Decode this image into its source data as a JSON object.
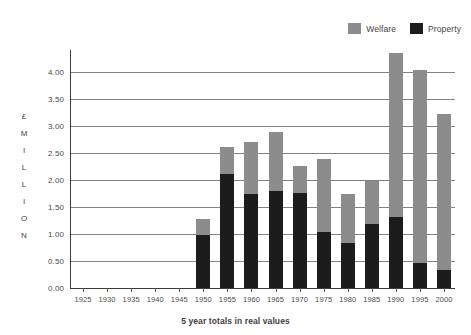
{
  "chart_data": {
    "type": "bar",
    "subtype": "stacked-vertical",
    "title": "",
    "xlabel": "5 year totals in real values",
    "ylabel": "£ MILLION",
    "ylabel_letters": [
      "£",
      "M",
      "I",
      "L",
      "L",
      "I",
      "O",
      "N"
    ],
    "categories": [
      "1925",
      "1930",
      "1935",
      "1940",
      "1945",
      "1950",
      "1955",
      "1960",
      "1965",
      "1970",
      "1975",
      "1980",
      "1985",
      "1990",
      "1995",
      "2000"
    ],
    "series": [
      {
        "name": "Property",
        "color": "#1c1c1c",
        "values": [
          0,
          0,
          0,
          0,
          0,
          0.98,
          2.1,
          1.73,
          1.79,
          1.75,
          1.03,
          0.84,
          1.19,
          1.31,
          0.47,
          0.34
        ]
      },
      {
        "name": "Welfare",
        "color": "#8c8c8c",
        "values": [
          0,
          0,
          0,
          0,
          0,
          0.29,
          0.5,
          0.97,
          1.09,
          0.5,
          1.36,
          0.89,
          0.79,
          3.04,
          3.57,
          2.88
        ]
      }
    ],
    "totals": [
      0,
      0,
      0,
      0,
      0,
      1.27,
      2.6,
      2.7,
      2.88,
      2.25,
      2.39,
      1.73,
      1.98,
      4.35,
      4.04,
      3.22
    ],
    "stack_order": [
      "Property",
      "Welfare"
    ],
    "ylim": [
      0,
      4.4
    ],
    "yticks": [
      0.0,
      0.5,
      1.0,
      1.5,
      2.0,
      2.5,
      3.0,
      3.5,
      4.0
    ],
    "ytick_labels": [
      "0.00",
      "0.50",
      "1.00",
      "1.50",
      "2.00",
      "2.50",
      "3.00",
      "3.50",
      "4.00"
    ],
    "grid": true,
    "grid_axis": "y",
    "legend": {
      "position": "top-right",
      "entries": [
        {
          "label": "Welfare",
          "color": "#8c8c8c"
        },
        {
          "label": "Property",
          "color": "#1c1c1c"
        }
      ]
    },
    "colors": {
      "welfare": "#8c8c8c",
      "property": "#1c1c1c",
      "grid": "#848484",
      "axis": "#3a3a3a",
      "text": "#4a4a4a",
      "background": "#ffffff"
    }
  }
}
